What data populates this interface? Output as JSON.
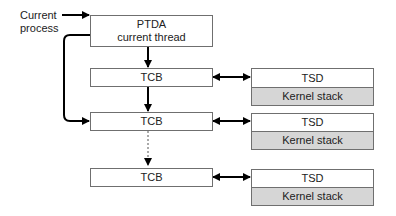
{
  "diagram": {
    "current_process_label": [
      "Current",
      "process"
    ],
    "ptda": {
      "line1": "PTDA",
      "line2": "current thread"
    },
    "threads": [
      {
        "tcb": "TCB",
        "tsd": "TSD",
        "kernel_stack": "Kernel stack"
      },
      {
        "tcb": "TCB",
        "tsd": "TSD",
        "kernel_stack": "Kernel stack"
      },
      {
        "tcb": "TCB",
        "tsd": "TSD",
        "kernel_stack": "Kernel stack"
      }
    ],
    "colors": {
      "box_border": "#6f6f6f",
      "kernel_stack_fill": "#d6d6d6",
      "arrow": "#000000"
    }
  }
}
